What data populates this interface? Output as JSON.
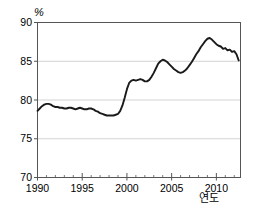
{
  "chart_data": {
    "type": "line",
    "title": "",
    "subtitle": "",
    "xlabel": "연도",
    "ylabel": "%",
    "unit_label": "%",
    "xlim": [
      1990,
      2012.7
    ],
    "ylim": [
      70,
      90
    ],
    "ytick_labels": [
      "90",
      "85",
      "80",
      "75",
      "70"
    ],
    "ytick_values": [
      90,
      85,
      80,
      75,
      70
    ],
    "xtick_labels": [
      "1990",
      "1995",
      "2000",
      "2005",
      "2010"
    ],
    "xtick_values": [
      1990,
      1995,
      2000,
      2005,
      2010
    ],
    "minor_xtick_interval": 1,
    "grid": "horizontal",
    "gridlines_at": [
      75,
      80,
      85
    ],
    "legend": null,
    "legend_position": "none",
    "line_color": "#1a1a1a",
    "line_width": 1.9,
    "plot_background": "#ffffff",
    "border_color": "#555555",
    "grid_color": "#c8c8c8",
    "series": [
      {
        "name": "",
        "x": [
          1990.0,
          1990.25,
          1990.5,
          1990.75,
          1991.0,
          1991.25,
          1991.5,
          1991.75,
          1992.0,
          1992.25,
          1992.5,
          1992.75,
          1993.0,
          1993.25,
          1993.5,
          1993.75,
          1994.0,
          1994.25,
          1994.5,
          1994.75,
          1995.0,
          1995.25,
          1995.5,
          1995.75,
          1996.0,
          1996.25,
          1996.5,
          1996.75,
          1997.0,
          1997.25,
          1997.5,
          1997.75,
          1998.0,
          1998.25,
          1998.5,
          1998.75,
          1999.0,
          1999.25,
          1999.5,
          1999.75,
          2000.0,
          2000.25,
          2000.5,
          2000.75,
          2001.0,
          2001.25,
          2001.5,
          2001.75,
          2002.0,
          2002.25,
          2002.5,
          2002.75,
          2003.0,
          2003.25,
          2003.5,
          2003.75,
          2004.0,
          2004.25,
          2004.5,
          2004.75,
          2005.0,
          2005.25,
          2005.5,
          2005.75,
          2006.0,
          2006.25,
          2006.5,
          2006.75,
          2007.0,
          2007.25,
          2007.5,
          2007.75,
          2008.0,
          2008.25,
          2008.5,
          2008.75,
          2009.0,
          2009.25,
          2009.5,
          2009.75,
          2010.0,
          2010.25,
          2010.5,
          2010.75,
          2011.0,
          2011.25,
          2011.5,
          2011.75,
          2012.0,
          2012.25,
          2012.5
        ],
        "values": [
          78.6,
          78.9,
          79.2,
          79.4,
          79.5,
          79.5,
          79.4,
          79.2,
          79.1,
          79.1,
          79.0,
          79.0,
          78.9,
          78.9,
          79.0,
          79.0,
          78.9,
          78.8,
          78.9,
          79.0,
          78.9,
          78.8,
          78.8,
          78.9,
          78.9,
          78.8,
          78.6,
          78.5,
          78.3,
          78.2,
          78.1,
          78.0,
          78.0,
          78.0,
          78.0,
          78.1,
          78.2,
          78.6,
          79.3,
          80.3,
          81.4,
          82.2,
          82.5,
          82.6,
          82.5,
          82.6,
          82.7,
          82.6,
          82.4,
          82.4,
          82.6,
          83.0,
          83.5,
          84.1,
          84.7,
          85.0,
          85.2,
          85.1,
          84.9,
          84.6,
          84.3,
          84.0,
          83.8,
          83.6,
          83.5,
          83.6,
          83.8,
          84.1,
          84.5,
          84.9,
          85.4,
          85.9,
          86.3,
          86.8,
          87.2,
          87.6,
          87.9,
          88.0,
          87.8,
          87.5,
          87.2,
          87.0,
          86.9,
          86.6,
          86.7,
          86.4,
          86.5,
          86.2,
          86.3,
          85.9,
          85.1
        ]
      }
    ]
  },
  "axes": {
    "unit_label": "%",
    "x_axis_title": "연도",
    "y_labels": [
      "90",
      "85",
      "80",
      "75",
      "70"
    ],
    "x_labels": [
      "1990",
      "1995",
      "2000",
      "2005",
      "2010"
    ]
  }
}
